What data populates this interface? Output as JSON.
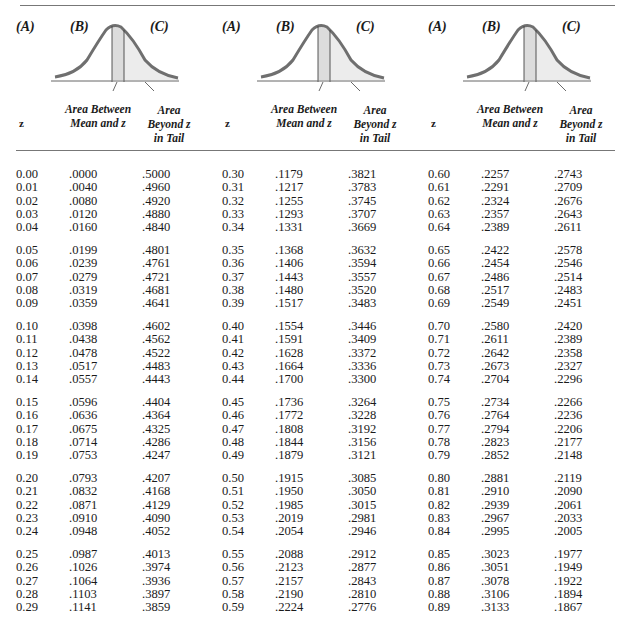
{
  "header": {
    "col_letters": [
      "(A)",
      "(B)",
      "(C)"
    ],
    "z_label": "z",
    "between_label_line1": "Area Between",
    "between_label_line2": "Mean and z",
    "tail_label_line1": "Area",
    "tail_label_line2": "Beyond z",
    "tail_label_line3": "in Tail"
  },
  "colors": {
    "curve": "#6f6f6f",
    "shade_between": "#dcdcdc",
    "shade_tail": "#ececec",
    "rule": "#777777"
  },
  "groups": [
    {
      "blocks": [
        [
          [
            "0.00",
            ".0000",
            ".5000"
          ],
          [
            "0.01",
            ".0040",
            ".4960"
          ],
          [
            "0.02",
            ".0080",
            ".4920"
          ],
          [
            "0.03",
            ".0120",
            ".4880"
          ],
          [
            "0.04",
            ".0160",
            ".4840"
          ]
        ],
        [
          [
            "0.05",
            ".0199",
            ".4801"
          ],
          [
            "0.06",
            ".0239",
            ".4761"
          ],
          [
            "0.07",
            ".0279",
            ".4721"
          ],
          [
            "0.08",
            ".0319",
            ".4681"
          ],
          [
            "0.09",
            ".0359",
            ".4641"
          ]
        ],
        [
          [
            "0.10",
            ".0398",
            ".4602"
          ],
          [
            "0.11",
            ".0438",
            ".4562"
          ],
          [
            "0.12",
            ".0478",
            ".4522"
          ],
          [
            "0.13",
            ".0517",
            ".4483"
          ],
          [
            "0.14",
            ".0557",
            ".4443"
          ]
        ],
        [
          [
            "0.15",
            ".0596",
            ".4404"
          ],
          [
            "0.16",
            ".0636",
            ".4364"
          ],
          [
            "0.17",
            ".0675",
            ".4325"
          ],
          [
            "0.18",
            ".0714",
            ".4286"
          ],
          [
            "0.19",
            ".0753",
            ".4247"
          ]
        ],
        [
          [
            "0.20",
            ".0793",
            ".4207"
          ],
          [
            "0.21",
            ".0832",
            ".4168"
          ],
          [
            "0.22",
            ".0871",
            ".4129"
          ],
          [
            "0.23",
            ".0910",
            ".4090"
          ],
          [
            "0.24",
            ".0948",
            ".4052"
          ]
        ],
        [
          [
            "0.25",
            ".0987",
            ".4013"
          ],
          [
            "0.26",
            ".1026",
            ".3974"
          ],
          [
            "0.27",
            ".1064",
            ".3936"
          ],
          [
            "0.28",
            ".1103",
            ".3897"
          ],
          [
            "0.29",
            ".1141",
            ".3859"
          ]
        ]
      ]
    },
    {
      "blocks": [
        [
          [
            "0.30",
            ".1179",
            ".3821"
          ],
          [
            "0.31",
            ".1217",
            ".3783"
          ],
          [
            "0.32",
            ".1255",
            ".3745"
          ],
          [
            "0.33",
            ".1293",
            ".3707"
          ],
          [
            "0.34",
            ".1331",
            ".3669"
          ]
        ],
        [
          [
            "0.35",
            ".1368",
            ".3632"
          ],
          [
            "0.36",
            ".1406",
            ".3594"
          ],
          [
            "0.37",
            ".1443",
            ".3557"
          ],
          [
            "0.38",
            ".1480",
            ".3520"
          ],
          [
            "0.39",
            ".1517",
            ".3483"
          ]
        ],
        [
          [
            "0.40",
            ".1554",
            ".3446"
          ],
          [
            "0.41",
            ".1591",
            ".3409"
          ],
          [
            "0.42",
            ".1628",
            ".3372"
          ],
          [
            "0.43",
            ".1664",
            ".3336"
          ],
          [
            "0.44",
            ".1700",
            ".3300"
          ]
        ],
        [
          [
            "0.45",
            ".1736",
            ".3264"
          ],
          [
            "0.46",
            ".1772",
            ".3228"
          ],
          [
            "0.47",
            ".1808",
            ".3192"
          ],
          [
            "0.48",
            ".1844",
            ".3156"
          ],
          [
            "0.49",
            ".1879",
            ".3121"
          ]
        ],
        [
          [
            "0.50",
            ".1915",
            ".3085"
          ],
          [
            "0.51",
            ".1950",
            ".3050"
          ],
          [
            "0.52",
            ".1985",
            ".3015"
          ],
          [
            "0.53",
            ".2019",
            ".2981"
          ],
          [
            "0.54",
            ".2054",
            ".2946"
          ]
        ],
        [
          [
            "0.55",
            ".2088",
            ".2912"
          ],
          [
            "0.56",
            ".2123",
            ".2877"
          ],
          [
            "0.57",
            ".2157",
            ".2843"
          ],
          [
            "0.58",
            ".2190",
            ".2810"
          ],
          [
            "0.59",
            ".2224",
            ".2776"
          ]
        ]
      ]
    },
    {
      "blocks": [
        [
          [
            "0.60",
            ".2257",
            ".2743"
          ],
          [
            "0.61",
            ".2291",
            ".2709"
          ],
          [
            "0.62",
            ".2324",
            ".2676"
          ],
          [
            "0.63",
            ".2357",
            ".2643"
          ],
          [
            "0.64",
            ".2389",
            ".2611"
          ]
        ],
        [
          [
            "0.65",
            ".2422",
            ".2578"
          ],
          [
            "0.66",
            ".2454",
            ".2546"
          ],
          [
            "0.67",
            ".2486",
            ".2514"
          ],
          [
            "0.68",
            ".2517",
            ".2483"
          ],
          [
            "0.69",
            ".2549",
            ".2451"
          ]
        ],
        [
          [
            "0.70",
            ".2580",
            ".2420"
          ],
          [
            "0.71",
            ".2611",
            ".2389"
          ],
          [
            "0.72",
            ".2642",
            ".2358"
          ],
          [
            "0.73",
            ".2673",
            ".2327"
          ],
          [
            "0.74",
            ".2704",
            ".2296"
          ]
        ],
        [
          [
            "0.75",
            ".2734",
            ".2266"
          ],
          [
            "0.76",
            ".2764",
            ".2236"
          ],
          [
            "0.77",
            ".2794",
            ".2206"
          ],
          [
            "0.78",
            ".2823",
            ".2177"
          ],
          [
            "0.79",
            ".2852",
            ".2148"
          ]
        ],
        [
          [
            "0.80",
            ".2881",
            ".2119"
          ],
          [
            "0.81",
            ".2910",
            ".2090"
          ],
          [
            "0.82",
            ".2939",
            ".2061"
          ],
          [
            "0.83",
            ".2967",
            ".2033"
          ],
          [
            "0.84",
            ".2995",
            ".2005"
          ]
        ],
        [
          [
            "0.85",
            ".3023",
            ".1977"
          ],
          [
            "0.86",
            ".3051",
            ".1949"
          ],
          [
            "0.87",
            ".3078",
            ".1922"
          ],
          [
            "0.88",
            ".3106",
            ".1894"
          ],
          [
            "0.89",
            ".3133",
            ".1867"
          ]
        ]
      ]
    }
  ]
}
